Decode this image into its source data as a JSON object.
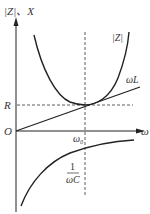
{
  "diagram": {
    "y_axis_label": "|Z|、X",
    "x_axis_label": "ω",
    "origin_label": "O",
    "r_label": "R",
    "omega0_label": "ω₀",
    "z_curve_label": "|Z|",
    "inductive_label": "ωL",
    "capacitive_label_num": "1",
    "capacitive_label_den": "ωC",
    "colors": {
      "line": "#222222",
      "text": "#333333",
      "background": "#ffffff"
    }
  }
}
